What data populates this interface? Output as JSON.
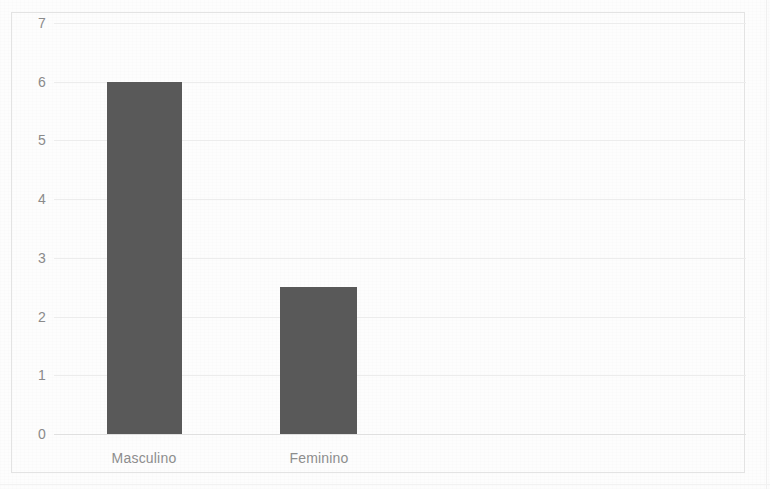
{
  "chart_data": {
    "type": "bar",
    "title": "",
    "subtitle": "",
    "xlabel": "",
    "ylabel": "",
    "categories": [
      "Masculino",
      "Feminino"
    ],
    "values": [
      6,
      2.5
    ],
    "series": [
      {
        "name": "",
        "values": [
          6,
          2.5
        ]
      }
    ],
    "ylim": [
      0,
      7
    ],
    "yticks": [
      7,
      6,
      5,
      4,
      3,
      2,
      1,
      0
    ],
    "ytick_labels": [
      "7",
      "6",
      "5",
      "4",
      "3",
      "2",
      "1",
      "0"
    ],
    "grid": true,
    "grid_axis": "y",
    "legend": false,
    "legend_position": "none",
    "annotations": [],
    "bar_color": "#595959",
    "gridline_color": "#ececec",
    "tick_label_color": "#8a8a8a",
    "frame_color": "#e3e3e3",
    "background_color": "#fdfdfd"
  }
}
